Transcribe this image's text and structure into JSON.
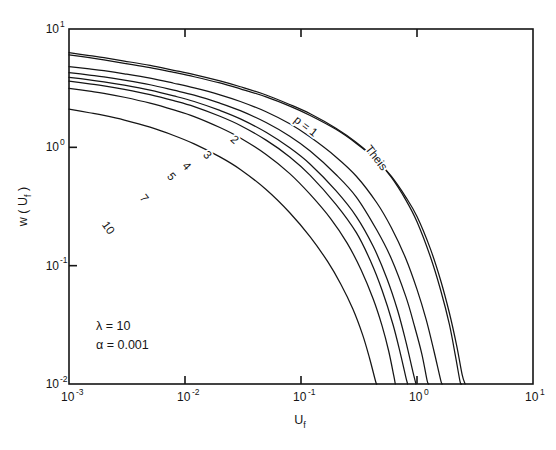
{
  "chart_data": {
    "type": "line",
    "title": "",
    "xlabel": "U_f",
    "ylabel": "w(U_f)",
    "xscale": "log",
    "yscale": "log",
    "xlim": [
      0.001,
      10
    ],
    "ylim": [
      0.01,
      10
    ],
    "grid": false,
    "legend": "inline-curve-labels",
    "xticks": [
      {
        "value": 0.001,
        "label_mantissa": "10",
        "label_exponent": "-3"
      },
      {
        "value": 0.01,
        "label_mantissa": "10",
        "label_exponent": "-2"
      },
      {
        "value": 0.1,
        "label_mantissa": "10",
        "label_exponent": "-1"
      },
      {
        "value": 1,
        "label_mantissa": "10",
        "label_exponent": "0"
      },
      {
        "value": 10,
        "label_mantissa": "10",
        "label_exponent": "1"
      }
    ],
    "yticks": [
      {
        "value": 0.01,
        "label_mantissa": "10",
        "label_exponent": "-2"
      },
      {
        "value": 0.1,
        "label_mantissa": "10",
        "label_exponent": "-1"
      },
      {
        "value": 1,
        "label_mantissa": "10",
        "label_exponent": "0"
      },
      {
        "value": 10,
        "label_mantissa": "10",
        "label_exponent": "1"
      }
    ],
    "annotations": [
      {
        "name": "lambda",
        "text": "λ = 10"
      },
      {
        "name": "alpha",
        "text": "α = 0.001"
      }
    ],
    "series": [
      {
        "name": "theis",
        "label": "Theis",
        "label_x": 0.42,
        "label_y": 0.78,
        "label_rotation": 52,
        "points": [
          [
            0.001,
            6.05
          ],
          [
            0.0015,
            5.72
          ],
          [
            0.002,
            5.48
          ],
          [
            0.003,
            5.13
          ],
          [
            0.005,
            4.72
          ],
          [
            0.008,
            4.3
          ],
          [
            0.012,
            3.95
          ],
          [
            0.02,
            3.5
          ],
          [
            0.03,
            3.12
          ],
          [
            0.05,
            2.67
          ],
          [
            0.08,
            2.23
          ],
          [
            0.12,
            1.86
          ],
          [
            0.2,
            1.42
          ],
          [
            0.3,
            1.08
          ],
          [
            0.45,
            0.78
          ],
          [
            0.6,
            0.57
          ],
          [
            0.8,
            0.38
          ],
          [
            1.0,
            0.26
          ],
          [
            1.3,
            0.14
          ],
          [
            1.6,
            0.075
          ],
          [
            1.9,
            0.04
          ],
          [
            2.2,
            0.021
          ],
          [
            2.45,
            0.012
          ],
          [
            2.6,
            0.01
          ]
        ]
      },
      {
        "name": "p1",
        "label": "p = 1",
        "label_x": 0.105,
        "label_y": 1.42,
        "label_rotation": 38,
        "points": [
          [
            0.001,
            6.3
          ],
          [
            0.0015,
            5.95
          ],
          [
            0.002,
            5.72
          ],
          [
            0.003,
            5.36
          ],
          [
            0.005,
            4.92
          ],
          [
            0.008,
            4.48
          ],
          [
            0.012,
            4.12
          ],
          [
            0.02,
            3.64
          ],
          [
            0.03,
            3.25
          ],
          [
            0.05,
            2.77
          ],
          [
            0.08,
            2.3
          ],
          [
            0.12,
            1.92
          ],
          [
            0.2,
            1.45
          ],
          [
            0.3,
            1.1
          ],
          [
            0.45,
            0.78
          ],
          [
            0.6,
            0.56
          ],
          [
            0.8,
            0.36
          ],
          [
            1.0,
            0.235
          ],
          [
            1.3,
            0.12
          ],
          [
            1.6,
            0.062
          ],
          [
            1.9,
            0.032
          ],
          [
            2.15,
            0.017
          ],
          [
            2.35,
            0.0105
          ],
          [
            2.42,
            0.01
          ]
        ]
      },
      {
        "name": "p2",
        "label": "2",
        "label_x": 0.0255,
        "label_y": 1.1,
        "label_rotation": 42,
        "points": [
          [
            0.001,
            4.82
          ],
          [
            0.0015,
            4.6
          ],
          [
            0.002,
            4.44
          ],
          [
            0.003,
            4.18
          ],
          [
            0.005,
            3.84
          ],
          [
            0.008,
            3.48
          ],
          [
            0.012,
            3.18
          ],
          [
            0.02,
            2.78
          ],
          [
            0.03,
            2.44
          ],
          [
            0.05,
            2.0
          ],
          [
            0.08,
            1.58
          ],
          [
            0.12,
            1.22
          ],
          [
            0.2,
            0.83
          ],
          [
            0.3,
            0.57
          ],
          [
            0.45,
            0.34
          ],
          [
            0.6,
            0.21
          ],
          [
            0.8,
            0.115
          ],
          [
            1.0,
            0.063
          ],
          [
            1.2,
            0.035
          ],
          [
            1.4,
            0.019
          ],
          [
            1.6,
            0.0108
          ],
          [
            1.65,
            0.01
          ]
        ]
      },
      {
        "name": "p3",
        "label": "3",
        "label_x": 0.0148,
        "label_y": 0.82,
        "label_rotation": 46,
        "points": [
          [
            0.001,
            4.28
          ],
          [
            0.0015,
            4.08
          ],
          [
            0.002,
            3.94
          ],
          [
            0.003,
            3.7
          ],
          [
            0.005,
            3.38
          ],
          [
            0.008,
            3.04
          ],
          [
            0.012,
            2.76
          ],
          [
            0.02,
            2.36
          ],
          [
            0.03,
            2.04
          ],
          [
            0.05,
            1.62
          ],
          [
            0.08,
            1.24
          ],
          [
            0.12,
            0.93
          ],
          [
            0.2,
            0.59
          ],
          [
            0.3,
            0.38
          ],
          [
            0.45,
            0.2
          ],
          [
            0.6,
            0.115
          ],
          [
            0.8,
            0.055
          ],
          [
            0.95,
            0.031
          ],
          [
            1.1,
            0.018
          ],
          [
            1.22,
            0.0108
          ],
          [
            1.26,
            0.01
          ]
        ]
      },
      {
        "name": "p4",
        "label": "4",
        "label_x": 0.0098,
        "label_y": 0.66,
        "label_rotation": 48,
        "points": [
          [
            0.001,
            3.9
          ],
          [
            0.0015,
            3.72
          ],
          [
            0.002,
            3.58
          ],
          [
            0.003,
            3.35
          ],
          [
            0.005,
            3.04
          ],
          [
            0.008,
            2.72
          ],
          [
            0.012,
            2.44
          ],
          [
            0.02,
            2.05
          ],
          [
            0.03,
            1.74
          ],
          [
            0.05,
            1.34
          ],
          [
            0.08,
            0.99
          ],
          [
            0.12,
            0.72
          ],
          [
            0.2,
            0.43
          ],
          [
            0.3,
            0.26
          ],
          [
            0.42,
            0.145
          ],
          [
            0.55,
            0.078
          ],
          [
            0.68,
            0.042
          ],
          [
            0.8,
            0.023
          ],
          [
            0.92,
            0.0128
          ],
          [
            0.98,
            0.01
          ]
        ]
      },
      {
        "name": "p5",
        "label": "5",
        "label_x": 0.0072,
        "label_y": 0.54,
        "label_rotation": 50,
        "points": [
          [
            0.001,
            3.62
          ],
          [
            0.0015,
            3.44
          ],
          [
            0.002,
            3.31
          ],
          [
            0.003,
            3.09
          ],
          [
            0.005,
            2.79
          ],
          [
            0.008,
            2.48
          ],
          [
            0.012,
            2.21
          ],
          [
            0.02,
            1.83
          ],
          [
            0.03,
            1.53
          ],
          [
            0.05,
            1.15
          ],
          [
            0.08,
            0.83
          ],
          [
            0.12,
            0.58
          ],
          [
            0.2,
            0.33
          ],
          [
            0.3,
            0.19
          ],
          [
            0.4,
            0.108
          ],
          [
            0.5,
            0.062
          ],
          [
            0.62,
            0.032
          ],
          [
            0.72,
            0.018
          ],
          [
            0.8,
            0.0115
          ],
          [
            0.83,
            0.01
          ]
        ]
      },
      {
        "name": "p7",
        "label": "7",
        "label_x": 0.0042,
        "label_y": 0.355,
        "label_rotation": 52,
        "points": [
          [
            0.001,
            3.15
          ],
          [
            0.0015,
            2.98
          ],
          [
            0.002,
            2.86
          ],
          [
            0.003,
            2.65
          ],
          [
            0.005,
            2.36
          ],
          [
            0.008,
            2.07
          ],
          [
            0.012,
            1.82
          ],
          [
            0.02,
            1.47
          ],
          [
            0.03,
            1.2
          ],
          [
            0.05,
            0.87
          ],
          [
            0.08,
            0.6
          ],
          [
            0.12,
            0.4
          ],
          [
            0.18,
            0.25
          ],
          [
            0.25,
            0.155
          ],
          [
            0.33,
            0.092
          ],
          [
            0.42,
            0.052
          ],
          [
            0.5,
            0.031
          ],
          [
            0.57,
            0.019
          ],
          [
            0.63,
            0.0118
          ],
          [
            0.65,
            0.01
          ]
        ]
      },
      {
        "name": "p10",
        "label": "10",
        "label_x": 0.00205,
        "label_y": 0.2,
        "label_rotation": 54,
        "points": [
          [
            0.001,
            2.1
          ],
          [
            0.0015,
            1.96
          ],
          [
            0.002,
            1.86
          ],
          [
            0.003,
            1.7
          ],
          [
            0.005,
            1.48
          ],
          [
            0.008,
            1.26
          ],
          [
            0.012,
            1.07
          ],
          [
            0.02,
            0.83
          ],
          [
            0.03,
            0.65
          ],
          [
            0.05,
            0.44
          ],
          [
            0.08,
            0.28
          ],
          [
            0.12,
            0.175
          ],
          [
            0.17,
            0.108
          ],
          [
            0.22,
            0.07
          ],
          [
            0.28,
            0.043
          ],
          [
            0.34,
            0.026
          ],
          [
            0.39,
            0.0165
          ],
          [
            0.44,
            0.0105
          ],
          [
            0.45,
            0.01
          ]
        ]
      }
    ]
  }
}
